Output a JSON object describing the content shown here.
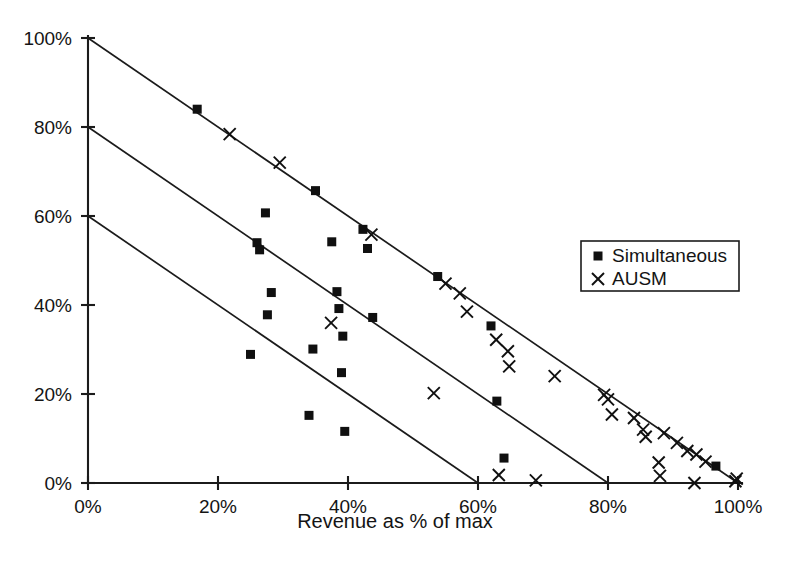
{
  "figure": {
    "background_color": "#ffffff",
    "ink_color": "#141414"
  },
  "legend": {
    "position": "right-middle",
    "entries": [
      {
        "label": "Simultaneous",
        "marker": "square",
        "marker_icon": "filled-square-marker-icon"
      },
      {
        "label": "AUSM",
        "marker": "cross",
        "marker_icon": "cross-marker-icon"
      }
    ]
  },
  "axes": {
    "x_title": "Revenue as % of max",
    "y_title": "",
    "x_ticks": [
      "0%",
      "20%",
      "40%",
      "60%",
      "80%",
      "100%"
    ],
    "y_ticks": [
      "0%",
      "20%",
      "40%",
      "60%",
      "80%",
      "100%"
    ]
  },
  "chart_data": {
    "type": "scatter",
    "title": "",
    "xlabel": "Revenue as % of max",
    "ylabel": "",
    "xlim": [
      0,
      100
    ],
    "ylim": [
      0,
      100
    ],
    "xticks": [
      0,
      20,
      40,
      60,
      80,
      100
    ],
    "yticks": [
      0,
      20,
      40,
      60,
      80,
      100
    ],
    "xticklabels": [
      "0%",
      "20%",
      "40%",
      "60%",
      "80%",
      "100%"
    ],
    "yticklabels": [
      "0%",
      "20%",
      "40%",
      "60%",
      "80%",
      "100%"
    ],
    "grid": false,
    "legend_position": "right-middle",
    "series": [
      {
        "name": "Simultaneous",
        "marker": "square",
        "color": "#101010",
        "points": [
          [
            16.8,
            84.0
          ],
          [
            25.0,
            28.9
          ],
          [
            26.0,
            54.0
          ],
          [
            26.4,
            52.4
          ],
          [
            27.3,
            60.7
          ],
          [
            27.6,
            37.8
          ],
          [
            28.2,
            42.8
          ],
          [
            34.0,
            15.2
          ],
          [
            34.6,
            30.1
          ],
          [
            35.0,
            65.7
          ],
          [
            37.5,
            54.2
          ],
          [
            38.3,
            43.0
          ],
          [
            38.6,
            39.2
          ],
          [
            39.0,
            24.8
          ],
          [
            39.2,
            33.0
          ],
          [
            39.5,
            11.6
          ],
          [
            42.3,
            57.0
          ],
          [
            43.0,
            52.7
          ],
          [
            43.8,
            37.2
          ],
          [
            53.8,
            46.4
          ],
          [
            62.0,
            35.3
          ],
          [
            62.9,
            18.4
          ],
          [
            64.0,
            5.6
          ],
          [
            96.6,
            3.8
          ]
        ]
      },
      {
        "name": "AUSM",
        "marker": "cross",
        "color": "#101010",
        "points": [
          [
            21.8,
            78.4
          ],
          [
            29.5,
            72.0
          ],
          [
            37.4,
            36.0
          ],
          [
            43.6,
            55.8
          ],
          [
            53.2,
            20.2
          ],
          [
            55.0,
            44.8
          ],
          [
            57.2,
            42.6
          ],
          [
            58.3,
            38.5
          ],
          [
            62.8,
            32.2
          ],
          [
            63.2,
            1.8
          ],
          [
            64.6,
            29.6
          ],
          [
            64.8,
            26.2
          ],
          [
            68.9,
            0.6
          ],
          [
            71.8,
            24.0
          ],
          [
            79.4,
            19.8
          ],
          [
            80.0,
            18.8
          ],
          [
            80.6,
            15.4
          ],
          [
            84.0,
            14.6
          ],
          [
            85.4,
            12.0
          ],
          [
            85.8,
            10.4
          ],
          [
            87.8,
            4.6
          ],
          [
            88.0,
            1.6
          ],
          [
            88.6,
            11.2
          ],
          [
            90.6,
            9.0
          ],
          [
            92.2,
            7.2
          ],
          [
            93.3,
            0.0
          ],
          [
            93.6,
            6.4
          ],
          [
            95.0,
            4.8
          ],
          [
            99.6,
            0.4
          ],
          [
            99.8,
            1.0
          ]
        ]
      }
    ],
    "reference_lines": [
      {
        "name": "sum-100",
        "from": [
          0,
          100
        ],
        "to": [
          100,
          0
        ],
        "equation": "x + y = 100%"
      },
      {
        "name": "sum-80",
        "from": [
          0,
          80
        ],
        "to": [
          80,
          0
        ],
        "equation": "x + y = 80%"
      },
      {
        "name": "sum-60",
        "from": [
          0,
          60
        ],
        "to": [
          60,
          0
        ],
        "equation": "x + y = 60%"
      }
    ]
  }
}
